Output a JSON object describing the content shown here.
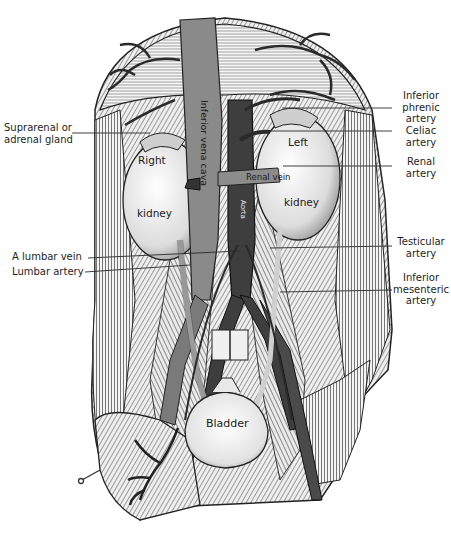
{
  "figure": {
    "colors": {
      "ink": "#1e1e1e",
      "vessel_dark": "#3a3a3a",
      "vessel_mid": "#6e6e6e",
      "vein_gray": "#8a8a8a",
      "tissue_light": "#d8d8d8",
      "paper": "#ffffff"
    }
  },
  "labels": {
    "left": [
      {
        "id": "suprarenal",
        "lines": [
          "Suprarenal or",
          "adrenal gland"
        ]
      },
      {
        "id": "lumbar_vein",
        "lines": [
          "A lumbar vein"
        ]
      },
      {
        "id": "lumbar_artery",
        "lines": [
          "Lumbar artery"
        ]
      }
    ],
    "right": [
      {
        "id": "inferior_phrenic",
        "lines": [
          "Inferior",
          "phrenic",
          "artery"
        ]
      },
      {
        "id": "celiac",
        "lines": [
          "Celiac",
          "artery"
        ]
      },
      {
        "id": "renal_artery",
        "lines": [
          "Renal",
          "artery"
        ]
      },
      {
        "id": "testicular",
        "lines": [
          "Testicular",
          "artery"
        ]
      },
      {
        "id": "inferior_mesenteric",
        "lines": [
          "Inferior",
          "mesenteric",
          "artery"
        ]
      }
    ],
    "inner": {
      "right_kidney_top": "Right",
      "right_kidney_bottom": "kidney",
      "left_kidney_top": "Left",
      "left_kidney_bottom": "kidney",
      "ivc": "Inferior vena cava",
      "renal_vein": "Renal vein",
      "aorta": "Aorta",
      "bladder": "Bladder",
      "ureter": "Ureter"
    }
  }
}
